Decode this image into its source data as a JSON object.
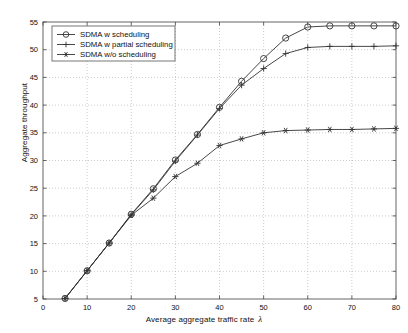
{
  "chart_data": {
    "type": "line",
    "title": "",
    "xlabel": "Average aggregate traffic rate",
    "xlabel_symbol": "λ",
    "ylabel": "Aggregate throughput",
    "xlim": [
      0,
      80
    ],
    "ylim": [
      5,
      55
    ],
    "xticks": [
      0,
      10,
      20,
      30,
      40,
      50,
      60,
      70,
      80
    ],
    "yticks": [
      5,
      10,
      15,
      20,
      25,
      30,
      35,
      40,
      45,
      50,
      55
    ],
    "grid": true,
    "legend_position": "upper-left",
    "x": [
      5,
      10,
      15,
      20,
      25,
      30,
      35,
      40,
      45,
      50,
      55,
      60,
      65,
      70,
      75,
      80
    ],
    "series": [
      {
        "name": "SDMA w scheduling",
        "marker": "circle",
        "color": "#333333",
        "values": [
          5.1,
          10.1,
          15.1,
          20.3,
          24.9,
          30.1,
          34.7,
          39.6,
          44.3,
          48.4,
          52.1,
          54.1,
          54.3,
          54.3,
          54.3,
          54.3
        ]
      },
      {
        "name": "SDMA w partial scheduling",
        "marker": "plus",
        "color": "#333333",
        "values": [
          5.1,
          10.1,
          15.1,
          20.2,
          24.7,
          29.9,
          34.6,
          39.4,
          43.6,
          46.6,
          49.3,
          50.4,
          50.6,
          50.6,
          50.6,
          50.7
        ]
      },
      {
        "name": "SDMA w/o scheduling",
        "marker": "star",
        "color": "#333333",
        "values": [
          5.1,
          10.1,
          15.1,
          20.1,
          23.2,
          27.1,
          29.5,
          32.7,
          33.9,
          35.0,
          35.4,
          35.5,
          35.6,
          35.6,
          35.7,
          35.8
        ]
      }
    ]
  },
  "legend": {
    "items": [
      {
        "label": "SDMA w scheduling"
      },
      {
        "label": "SDMA w partial scheduling"
      },
      {
        "label": "SDMA w/o scheduling"
      }
    ]
  },
  "axes": {
    "x_tick_labels": [
      "0",
      "10",
      "20",
      "30",
      "40",
      "50",
      "60",
      "70",
      "80"
    ],
    "y_tick_labels": [
      "5",
      "10",
      "15",
      "20",
      "25",
      "30",
      "35",
      "40",
      "45",
      "50",
      "55"
    ],
    "x_title": "Average aggregate traffic rate",
    "x_symbol": "λ",
    "y_title": "Aggregate throughput"
  }
}
